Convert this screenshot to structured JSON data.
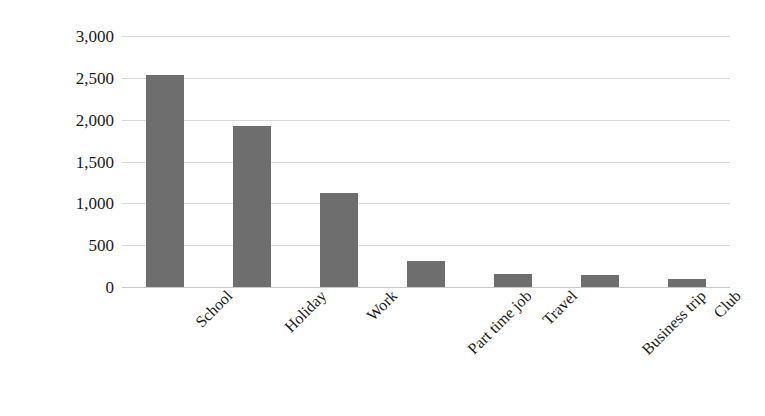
{
  "chart_data": {
    "type": "bar",
    "title": "",
    "xlabel": "",
    "ylabel": "Number of selections",
    "categories": [
      "School",
      "Holiday",
      "Work",
      "Part time job",
      "Travel",
      "Business trip",
      "Club"
    ],
    "values": [
      2530,
      1930,
      1120,
      310,
      150,
      140,
      100
    ],
    "ylim": [
      0,
      3000
    ],
    "ytick_values": [
      0,
      500,
      1000,
      1500,
      2000,
      2500,
      3000
    ],
    "ytick_labels": [
      "0",
      "500",
      "1,000",
      "1,500",
      "2,000",
      "2,500",
      "3,000"
    ],
    "grid": true,
    "legend": false,
    "bar_color": "#6e6e6e",
    "gridline_color": "#d8d8d8",
    "axis_color": "#c9c9c9",
    "label_rotation_deg": -45
  }
}
